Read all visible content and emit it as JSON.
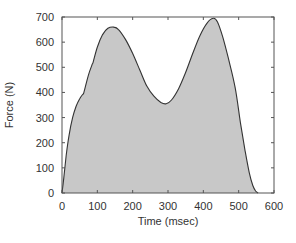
{
  "chart_data": {
    "type": "area",
    "title": "",
    "xlabel": "Time (msec)",
    "ylabel": "Force (N)",
    "xlim": [
      0,
      600
    ],
    "ylim": [
      0,
      700
    ],
    "xticks": [
      0,
      100,
      200,
      300,
      400,
      500,
      600
    ],
    "yticks": [
      0,
      100,
      200,
      300,
      400,
      500,
      600,
      700
    ],
    "grid": false,
    "legend": null,
    "fill_color": "#c8c8c8",
    "line_color": "#333333",
    "series": [
      {
        "name": "Force",
        "x": [
          0,
          5,
          12,
          20,
          30,
          40,
          50,
          60,
          62,
          75,
          85,
          88,
          100,
          115,
          130,
          147,
          160,
          180,
          200,
          220,
          240,
          260,
          280,
          295,
          310,
          330,
          350,
          370,
          390,
          410,
          428,
          440,
          455,
          470,
          490,
          505,
          518,
          530,
          540,
          548,
          555
        ],
        "y": [
          0,
          60,
          150,
          230,
          300,
          345,
          375,
          395,
          400,
          470,
          510,
          520,
          580,
          630,
          655,
          660,
          650,
          610,
          555,
          490,
          425,
          385,
          360,
          355,
          370,
          415,
          480,
          555,
          625,
          675,
          695,
          680,
          620,
          540,
          420,
          280,
          170,
          80,
          30,
          8,
          0
        ]
      }
    ]
  }
}
